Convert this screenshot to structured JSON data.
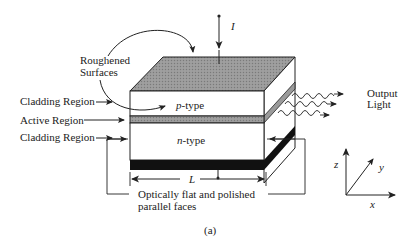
{
  "diagram": {
    "type": "semiconductor laser structure",
    "labels": {
      "current": "I",
      "roughened_surfaces_line1": "Roughened",
      "roughened_surfaces_line2": "Surfaces",
      "cladding_top": "Cladding Region",
      "active": "Active Region",
      "cladding_bottom": "Cladding Region",
      "p_type_italic": "p",
      "p_type_rest": "-type",
      "n_type_italic": "n",
      "n_type_rest": "-type",
      "output_line1": "Output",
      "output_line2": "Light",
      "length": "L",
      "faces_line1": "Optically flat and polished",
      "faces_line2": "parallel faces",
      "axis_x": "x",
      "axis_y": "y",
      "axis_z": "z",
      "caption": "(a)"
    },
    "colors": {
      "top_face": "#8c8c8c",
      "active_layer": "#9a9a9a",
      "contact": "#111111",
      "line": "#222222",
      "background": "#ffffff"
    }
  }
}
